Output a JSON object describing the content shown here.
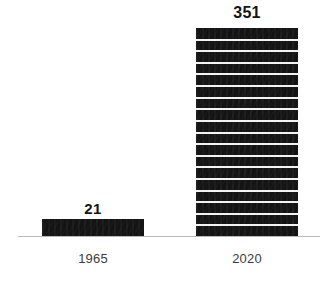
{
  "chart_data": {
    "type": "bar",
    "title": "",
    "subtitle": "",
    "xlabel": "",
    "ylabel": "",
    "categories": [
      "1965",
      "2020"
    ],
    "values": [
      21,
      351
    ],
    "value_labels": [
      "21",
      "351"
    ],
    "ylim": [
      0,
      351
    ],
    "grid": false,
    "legend": null,
    "orientation": "vertical",
    "annotations": [],
    "style": {
      "bar_color": "#141414",
      "stripe_color": "#f3f3f3",
      "axis_color": "#b9b9b9",
      "value_label_color": "#151515",
      "category_label_color": "#3c3c3c",
      "background": "#ffffff",
      "stripe_count": 18
    }
  },
  "bars": [
    {
      "category": "1965",
      "value_label": "21",
      "name": "bar-1965"
    },
    {
      "category": "2020",
      "value_label": "351",
      "name": "bar-2020"
    }
  ]
}
